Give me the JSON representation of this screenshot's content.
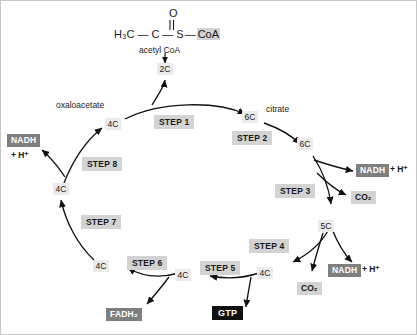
{
  "diagram": {
    "molecule": {
      "methyl": "H₃C",
      "carbonyl_carbon": "C",
      "oxygen": "O",
      "sulfur": "S",
      "coa": "CoA",
      "caption": "acetyl CoA"
    },
    "nodes": {
      "entry_2c": "2C",
      "oxaloacetate_4c": "4C",
      "citrate_6c": "6C",
      "step2_product_6c": "6C",
      "five_c": "5C",
      "step4_product_4c": "4C",
      "step5_product_4c": "4C",
      "step6_product_4c": "4C",
      "step7_product_4c": "4C"
    },
    "names": {
      "oxaloacetate": "oxaloacetate",
      "citrate": "citrate"
    },
    "steps": {
      "step1": "STEP 1",
      "step2": "STEP 2",
      "step3": "STEP 3",
      "step4": "STEP 4",
      "step5": "STEP 5",
      "step6": "STEP 6",
      "step7": "STEP 7",
      "step8": "STEP 8"
    },
    "products": {
      "nadh": "NADH",
      "h_plus": "+ H⁺",
      "co2": "CO₂",
      "fadh2": "FADH₂",
      "gtp": "GTP"
    },
    "colors": {
      "node_chip": "#eceaea",
      "step_box": "#d3d3d3",
      "product_dark": "#7f7f7f",
      "product_light": "#d3d3d3",
      "product_black": "#111111",
      "text": "#1a1a1a",
      "stroke": "#111111",
      "background": "#ffffff"
    }
  }
}
